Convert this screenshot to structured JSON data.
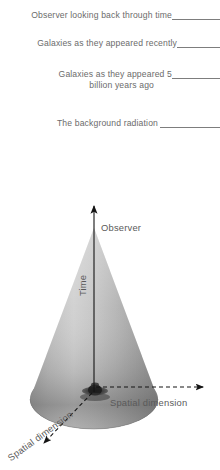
{
  "figure": {
    "background_color": "#ffffff",
    "text_color": "#6b6b6b",
    "leader_line_color": "#7d7d7d",
    "cone_color_light": "#c9c9c9",
    "cone_color_dark": "#6e6e6e",
    "axis_color": "#1a1a1a"
  },
  "callouts": [
    {
      "id": "observer",
      "text": "Observer looking back through time",
      "leader": "solid-line-to-right-edge"
    },
    {
      "id": "recent",
      "text": "Galaxies as they appeared recently",
      "leader": "solid-line-to-right-edge"
    },
    {
      "id": "five_billion",
      "line1": "Galaxies as they appeared 5",
      "line2": "billion years ago",
      "leader": "solid-line-to-right-edge"
    },
    {
      "id": "background",
      "text": "The background radiation",
      "leader": "solid-line-to-right-edge"
    }
  ],
  "diagram": {
    "axes": [
      {
        "id": "time",
        "label": "Time",
        "direction": "up",
        "style": "solid-arrow"
      },
      {
        "id": "spatial_horizontal",
        "label": "Spatial dimension",
        "direction": "right",
        "style": "dashed-arrow"
      },
      {
        "id": "spatial_depth",
        "label": "Spatial dimension",
        "direction": "down-left",
        "style": "dashed-arrow"
      }
    ],
    "apex_label": "Observer",
    "object_at_origin": "galaxy"
  }
}
